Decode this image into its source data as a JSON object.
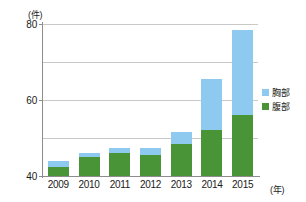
{
  "chart_data": {
    "type": "bar",
    "stacked": true,
    "title": "",
    "xlabel": "(年)",
    "ylabel": "(件)",
    "categories": [
      "2009",
      "2010",
      "2011",
      "2012",
      "2013",
      "2014",
      "2015"
    ],
    "series": [
      {
        "name": "腹部",
        "color": "#4a9438",
        "values": [
          5,
          10,
          12,
          11,
          17,
          24,
          32
        ]
      },
      {
        "name": "胸部",
        "color": "#8ecaf0",
        "values": [
          3,
          2,
          3,
          4,
          6,
          27,
          45
        ]
      }
    ],
    "totals": [
      8,
      12,
      15,
      15,
      23,
      51,
      77
    ],
    "ylim": [
      0,
      80
    ],
    "yticks": [
      0,
      20,
      40,
      60,
      80
    ],
    "ytick_labels": [
      "0",
      "20",
      "40",
      "60",
      "80"
    ],
    "grid": true,
    "legend_position": "right"
  },
  "legend": {
    "items": [
      {
        "label": "胸部",
        "color": "#8ecaf0"
      },
      {
        "label": "腹部",
        "color": "#4a9438"
      }
    ]
  },
  "axis": {
    "y_unit": "(件)",
    "x_unit": "(年)"
  }
}
